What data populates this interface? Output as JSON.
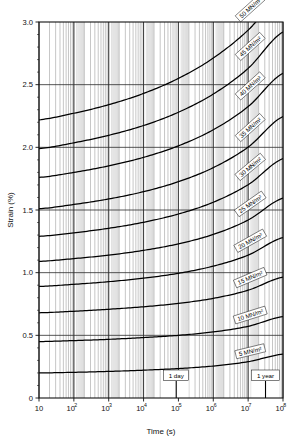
{
  "figure": {
    "name": "creep-curves-chart",
    "background": "#ffffff",
    "ink": "#000000"
  },
  "chart_data": {
    "type": "line",
    "title": "",
    "subtitle": "",
    "xlabel": "Time (s)",
    "ylabel": "Strain (%)",
    "xscale": "log",
    "yscale": "linear",
    "xlim": [
      10,
      100000000
    ],
    "ylim": [
      0,
      3.0
    ],
    "grid": true,
    "grid_description": "Full logarithmic minor vertical gridlines across every decade plus horizontal gridlines at each 0.5 % strain division",
    "legend_position": "inline-labels-on-curves",
    "x_tick_labels": [
      "10",
      "10^2",
      "10^3",
      "10^4",
      "10^5",
      "10^6",
      "10^7",
      "10^8"
    ],
    "x_tick_values": [
      10,
      100,
      1000,
      10000,
      100000,
      1000000,
      10000000,
      100000000
    ],
    "x_tick_mantissa": [
      "10",
      "10",
      "10",
      "10",
      "10",
      "10",
      "10",
      "10"
    ],
    "x_tick_exponents": [
      "",
      "2",
      "3",
      "4",
      "5",
      "6",
      "7",
      "8"
    ],
    "y_tick_labels": [
      "0",
      "0.5",
      "1.0",
      "1.5",
      "2.0",
      "2.5",
      "3.0"
    ],
    "y_tick_values": [
      0,
      0.5,
      1.0,
      1.5,
      2.0,
      2.5,
      3.0
    ],
    "series_unit": "MN/m^2",
    "x": [
      10,
      100,
      1000,
      10000,
      100000,
      1000000,
      10000000,
      100000000
    ],
    "series": [
      {
        "name": "5 MN/m²",
        "label": "5 MN/m²",
        "stress": 5,
        "values": [
          0.2,
          0.205,
          0.212,
          0.222,
          0.235,
          0.255,
          0.29,
          0.35
        ]
      },
      {
        "name": "10 MN/m²",
        "label": "10 MN/m²",
        "stress": 10,
        "values": [
          0.45,
          0.458,
          0.468,
          0.482,
          0.5,
          0.527,
          0.572,
          0.65
        ]
      },
      {
        "name": "15 MN/m²",
        "label": "15 MN/m²",
        "stress": 15,
        "values": [
          0.68,
          0.692,
          0.708,
          0.728,
          0.755,
          0.795,
          0.86,
          0.965
        ]
      },
      {
        "name": "20 MN/m²",
        "label": "20 MN/m²",
        "stress": 20,
        "values": [
          0.89,
          0.907,
          0.928,
          0.956,
          0.995,
          1.052,
          1.14,
          1.28
        ]
      },
      {
        "name": "25 MN/m²",
        "label": "25 MN/m²",
        "stress": 25,
        "values": [
          1.09,
          1.112,
          1.14,
          1.178,
          1.23,
          1.305,
          1.42,
          1.595
        ]
      },
      {
        "name": "30 MN/m²",
        "label": "30 MN/m²",
        "stress": 30,
        "values": [
          1.29,
          1.318,
          1.354,
          1.402,
          1.468,
          1.562,
          1.702,
          1.91
        ]
      },
      {
        "name": "35 MN/m²",
        "label": "35 MN/m²",
        "stress": 35,
        "values": [
          1.51,
          1.544,
          1.588,
          1.646,
          1.726,
          1.838,
          2.002,
          2.245
        ]
      },
      {
        "name": "40 MN/m²",
        "label": "40 MN/m²",
        "stress": 40,
        "values": [
          1.76,
          1.8,
          1.852,
          1.92,
          2.012,
          2.14,
          2.325,
          2.59
        ]
      },
      {
        "name": "45 MN/m²",
        "label": "45 MN/m²",
        "stress": 45,
        "values": [
          1.99,
          2.036,
          2.096,
          2.174,
          2.28,
          2.425,
          2.63,
          2.92
        ]
      },
      {
        "name": "50 MN/m²",
        "label": "50 MN/m²",
        "stress": 50,
        "values": [
          2.22,
          2.272,
          2.34,
          2.43,
          2.55,
          2.712,
          2.935,
          3.23
        ]
      }
    ],
    "annotations": [
      {
        "name": "one-day-marker",
        "text": "1 day",
        "x": 86400,
        "x_label": "8.64×10⁴ s"
      },
      {
        "name": "one-year-marker",
        "text": "1 year",
        "x": 31500000,
        "x_label": "3.15×10⁷ s"
      }
    ]
  }
}
